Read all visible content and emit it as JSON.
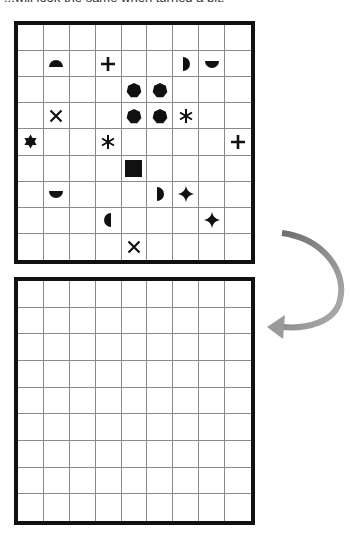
{
  "caption": "...will look the same when turned a bit.",
  "colors": {
    "symbol": "#111111",
    "grid_border": "#111111",
    "grid_line": "#8a8a8a",
    "arrow": "#8c8c8c"
  },
  "top_grid": {
    "rows": 9,
    "cols": 9,
    "symbols": [
      {
        "row": 1,
        "col": 1,
        "shape": "half-circle-top-icon"
      },
      {
        "row": 1,
        "col": 3,
        "shape": "plus-icon"
      },
      {
        "row": 1,
        "col": 6,
        "shape": "half-circle-right-icon"
      },
      {
        "row": 1,
        "col": 7,
        "shape": "half-circle-bottom-icon"
      },
      {
        "row": 2,
        "col": 4,
        "shape": "heptagon-icon"
      },
      {
        "row": 2,
        "col": 5,
        "shape": "heptagon-icon"
      },
      {
        "row": 3,
        "col": 1,
        "shape": "x-icon"
      },
      {
        "row": 3,
        "col": 4,
        "shape": "heptagon-icon"
      },
      {
        "row": 3,
        "col": 5,
        "shape": "heptagon-icon"
      },
      {
        "row": 3,
        "col": 6,
        "shape": "asterisk-icon"
      },
      {
        "row": 4,
        "col": 0,
        "shape": "six-point-star-icon"
      },
      {
        "row": 4,
        "col": 3,
        "shape": "asterisk-icon"
      },
      {
        "row": 4,
        "col": 8,
        "shape": "plus-icon"
      },
      {
        "row": 5,
        "col": 4,
        "shape": "square-icon"
      },
      {
        "row": 6,
        "col": 1,
        "shape": "half-circle-bottom-icon"
      },
      {
        "row": 6,
        "col": 5,
        "shape": "half-circle-right-icon"
      },
      {
        "row": 6,
        "col": 6,
        "shape": "four-point-star-icon"
      },
      {
        "row": 7,
        "col": 3,
        "shape": "half-circle-left-icon"
      },
      {
        "row": 7,
        "col": 7,
        "shape": "four-point-star-icon"
      },
      {
        "row": 8,
        "col": 4,
        "shape": "x-icon"
      }
    ]
  },
  "bottom_grid": {
    "rows": 9,
    "cols": 9,
    "symbols": []
  },
  "arrow": {
    "icon": "curved-arrow-icon",
    "direction": "clockwise-down-left"
  }
}
